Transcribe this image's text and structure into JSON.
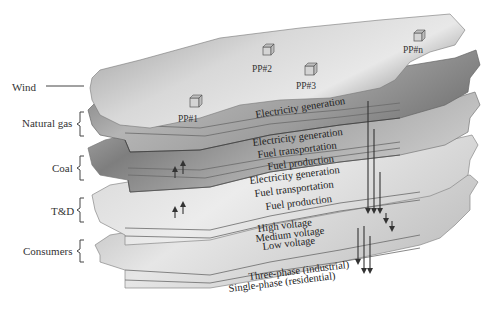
{
  "diagram": {
    "side_labels": {
      "wind": "Wind",
      "natural_gas": "Natural gas",
      "coal": "Coal",
      "td": "T&D",
      "consumers": "Consumers"
    },
    "power_plants": [
      "PP#1",
      "PP#2",
      "PP#3",
      "PP#n"
    ],
    "wind_layer": {
      "label": "Electricity generation"
    },
    "natural_gas_layers": [
      "Electricity generation",
      "Fuel transportation",
      "Fuel production"
    ],
    "coal_layers": [
      "Electricity generation",
      "Fuel transportation",
      "Fuel production"
    ],
    "td_layers": [
      "High voltage",
      "Medium voltage",
      "Low voltage"
    ],
    "consumer_layers": [
      "Three-phase (industrial)",
      "Single-phase (residential)"
    ],
    "colors": {
      "wind_dark": "#8a8a8a",
      "wind_light": "#dcdcdc",
      "gas_dark": "#7c7c7c",
      "coal_mid": "#a0a0a0",
      "td_light": "#e6e6e6",
      "consumer_light": "#e2e2e2"
    }
  }
}
